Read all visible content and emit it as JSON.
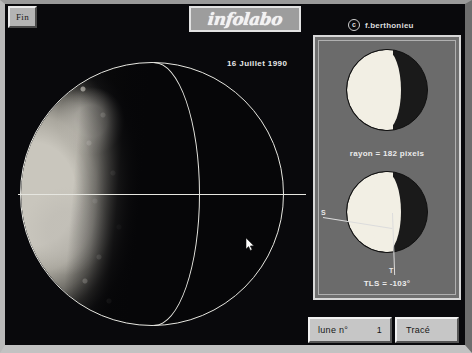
{
  "window": {
    "close_label": "Fin",
    "brand": "infolabo",
    "copyright_mark": "c",
    "copyright_name": "f.berthonieu"
  },
  "main_view": {
    "date_label": "16 Juillet 1990",
    "cursor": {
      "x": 241,
      "y": 233
    },
    "overlays": {
      "fitted_circle": "limb-circle",
      "terminator_arc": "terminator-ellipse",
      "equator_line": "equator-line"
    }
  },
  "panel": {
    "diagram_1": {
      "name": "phase-diagram-radius",
      "caption": "rayon = 182 pixels",
      "radius_pixels": 182
    },
    "diagram_2": {
      "name": "phase-diagram-tls",
      "caption": "TLS = -103°",
      "tls_degrees": -103,
      "label_s": "S",
      "label_t": "T"
    }
  },
  "toolbar": {
    "moon_label": "lune n°",
    "moon_number": "1",
    "trace_label": "Tracé"
  },
  "colors": {
    "frame": "#b9b9b9",
    "panel_bg": "#6f6f6f",
    "overlay_line": "#e6e6e0",
    "lit_surface": "#f2efe4",
    "background": "#09090c"
  }
}
